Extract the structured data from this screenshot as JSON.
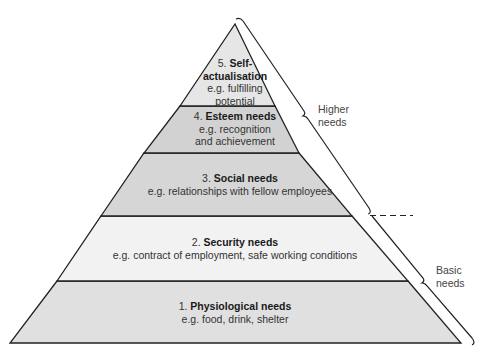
{
  "diagram": {
    "tiers": [
      {
        "number": "5.",
        "name": "Self-actualisation",
        "name_line1": "Self-",
        "name_line2": "actualisation",
        "example": "e.g. fulfilling potential",
        "example_line1": "e.g. fulfilling",
        "example_line2": "potential",
        "fill": "#e6e6e6"
      },
      {
        "number": "4.",
        "name": "Esteem needs",
        "example_line1": "e.g. recognition",
        "example_line2": "and achievement",
        "fill": "#d2d2d2"
      },
      {
        "number": "3.",
        "name": "Social needs",
        "example": "e.g. relationships with fellow employees",
        "fill": "#d6d6d6"
      },
      {
        "number": "2.",
        "name": "Security needs",
        "example": "e.g. contract of employment, safe working conditions",
        "fill": "#f2f2f2"
      },
      {
        "number": "1.",
        "name": "Physiological needs",
        "example": "e.g. food, drink, shelter",
        "fill": "#e0e0e0"
      }
    ],
    "groups": [
      {
        "label_line1": "Higher",
        "label_line2": "needs",
        "covers": [
          "5",
          "4",
          "3"
        ]
      },
      {
        "label_line1": "Basic",
        "label_line2": "needs",
        "covers": [
          "2",
          "1"
        ]
      }
    ],
    "colors": {
      "outline": "#222222",
      "background": "#ffffff"
    }
  }
}
